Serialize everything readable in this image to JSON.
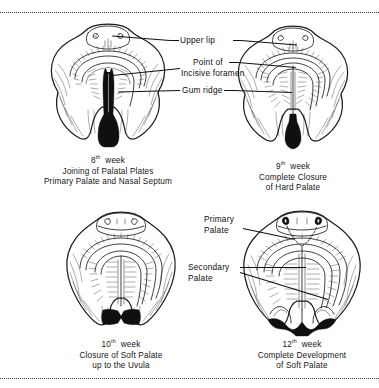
{
  "figure": {
    "border_style": "dotted",
    "ink_color": "#1d1d1d",
    "background": "#ffffff"
  },
  "callouts": {
    "upper_lip": "Upper lip",
    "point_of": "Point of",
    "incisive_foramen": "Incisive foramen",
    "gum_ridge": "Gum ridge",
    "primary_palate_l1": "Primary",
    "primary_palate_l2": "Palate",
    "secondary_palate_l1": "Secondary",
    "secondary_palate_l2": "Palate"
  },
  "panels": [
    {
      "id": "week-8",
      "week_number": "8",
      "week_ordinal": "th",
      "week_word": "week",
      "caption_line_2": "Joining of Palatal Plates",
      "caption_line_3": "Primary Palate and Nasal Septum"
    },
    {
      "id": "week-9",
      "week_number": "9",
      "week_ordinal": "th",
      "week_word": "week",
      "caption_line_2": "Complete Closure",
      "caption_line_3": "of Hard Palate"
    },
    {
      "id": "week-10",
      "week_number": "10",
      "week_ordinal": "th",
      "week_word": "week",
      "caption_line_2": "Closure of Soft Palate",
      "caption_line_3": "up to the Uvula"
    },
    {
      "id": "week-12",
      "week_number": "12",
      "week_ordinal": "th",
      "week_word": "week",
      "caption_line_2": "Complete Development",
      "caption_line_3": "of Soft Palate"
    }
  ]
}
